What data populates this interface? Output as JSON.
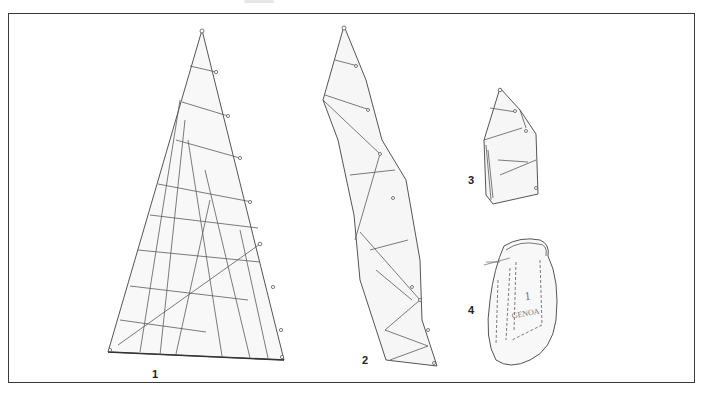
{
  "figure": {
    "steps": [
      {
        "number": "1",
        "label": "1",
        "caption": "Sail laid flat"
      },
      {
        "number": "2",
        "label": "2",
        "caption": "Sail flaked along the luff"
      },
      {
        "number": "3",
        "label": "3",
        "caption": "Sail rolled/folded"
      },
      {
        "number": "4",
        "label": "4",
        "caption": "Sail packed in bag"
      }
    ],
    "bag_text": {
      "line1": "1",
      "line2": "GENOA"
    },
    "colors": {
      "line": "#5a5a5a",
      "fill": "#f7f7f7",
      "frame": "#3a3a3a"
    }
  }
}
